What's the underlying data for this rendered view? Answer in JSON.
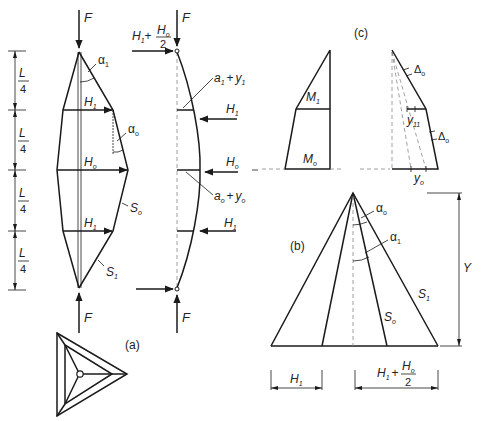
{
  "figure": {
    "panel_a_label": "(a)",
    "panel_b_label": "(b)",
    "panel_c_label": "(c)"
  },
  "panel_a": {
    "load_top": "F",
    "load_bottom": "F",
    "dimension_labels": [
      "L",
      "L",
      "L",
      "L"
    ],
    "dimension_denominator": "4",
    "angle_top": {
      "base": "α",
      "sub": "1"
    },
    "angle_mid": {
      "base": "α",
      "sub": "o"
    },
    "force_upper": {
      "base": "H",
      "sub": "1"
    },
    "force_middle": {
      "base": "H",
      "sub": "o"
    },
    "force_lower": {
      "base": "H",
      "sub": "1"
    },
    "strut_middle": {
      "base": "S",
      "sub": "o"
    },
    "strut_end": {
      "base": "S",
      "sub": "1"
    }
  },
  "panel_a_deflected": {
    "load_top": "F",
    "load_bottom": "F",
    "end_force_prefix": "H",
    "end_force_prefix_sub": "1",
    "end_force_plus": "+",
    "end_force_num": {
      "base": "H",
      "sub": "o"
    },
    "end_force_den": "2",
    "eccentricity_upper": {
      "a": "a",
      "a_sub": "1",
      "plus": "+",
      "y": "y",
      "y_sub": "1"
    },
    "eccentricity_middle": {
      "a": "a",
      "a_sub": "o",
      "plus": "+",
      "y": "y",
      "y_sub": "o"
    },
    "force_upper": {
      "base": "H",
      "sub": "1"
    },
    "force_middle": {
      "base": "H",
      "sub": "o"
    },
    "force_lower": {
      "base": "H",
      "sub": "1"
    }
  },
  "panel_b": {
    "angle_inner": {
      "base": "α",
      "sub": "o"
    },
    "angle_outer": {
      "base": "α",
      "sub": "1"
    },
    "strut_inner": {
      "base": "S",
      "sub": "o"
    },
    "strut_outer": {
      "base": "S",
      "sub": "1"
    },
    "height_label": "Y",
    "base_left": {
      "base": "H",
      "sub": "1"
    },
    "base_right_prefix": {
      "base": "H",
      "sub": "1"
    },
    "base_right_plus": "+",
    "base_right_num": {
      "base": "H",
      "sub": "o"
    },
    "base_right_den": "2"
  },
  "panel_c": {
    "moment_upper": {
      "base": "M",
      "sub": "1"
    },
    "moment_lower": {
      "base": "M",
      "sub": "o"
    },
    "delta_upper": {
      "base": "Δ",
      "sub": "o"
    },
    "delta_lower": {
      "base": "Δ",
      "sub": "o"
    },
    "deflection_upper": {
      "base": "y",
      "sub": "11"
    },
    "deflection_lower": {
      "base": "y",
      "sub": "o"
    }
  }
}
